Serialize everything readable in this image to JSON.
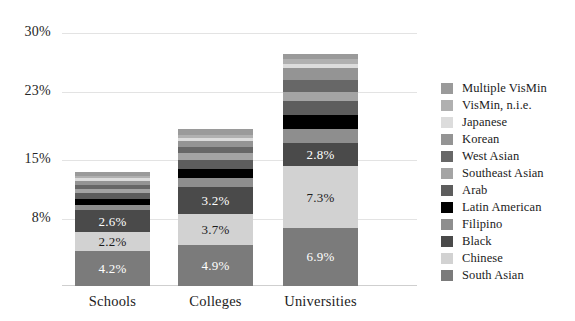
{
  "chart_data": {
    "type": "bar",
    "subtype": "stacked-bar",
    "title": "",
    "xlabel": "",
    "ylabel": "",
    "categories": [
      "Schools",
      "Colleges",
      "Universities"
    ],
    "ylim": [
      0,
      31
    ],
    "yticks": [
      8,
      15,
      23,
      30
    ],
    "ytick_labels": [
      "8%",
      "15%",
      "23%",
      "30%"
    ],
    "grid": true,
    "legend_position": "right",
    "value_suffix": "%",
    "stack_order": "bottom-to-top",
    "series": [
      {
        "name": "South Asian",
        "color": "#7b7b7b",
        "values": [
          4.2,
          4.9,
          6.9
        ],
        "labels": [
          "4.2%",
          "4.9%",
          "6.9%"
        ],
        "label_color": "#ffffff"
      },
      {
        "name": "Chinese",
        "color": "#d2d2d2",
        "values": [
          2.2,
          3.7,
          7.3
        ],
        "labels": [
          "2.2%",
          "3.7%",
          "7.3%"
        ],
        "label_color": "#1c1c1c"
      },
      {
        "name": "Black",
        "color": "#4a4a4a",
        "values": [
          2.6,
          3.2,
          2.8
        ],
        "labels": [
          "2.6%",
          "3.2%",
          "2.8%"
        ],
        "label_color": "#ffffff"
      },
      {
        "name": "Filipino",
        "color": "#8e8e8e",
        "values": [
          0.6,
          1.0,
          1.7
        ],
        "labels": [
          "",
          "",
          ""
        ],
        "label_color": "#ffffff"
      },
      {
        "name": "Latin American",
        "color": "#000000",
        "values": [
          0.7,
          1.1,
          1.6
        ],
        "labels": [
          "",
          "",
          ""
        ],
        "label_color": "#ffffff"
      },
      {
        "name": "Arab",
        "color": "#5d5d5d",
        "values": [
          0.7,
          1.1,
          1.7
        ],
        "labels": [
          "",
          "",
          ""
        ],
        "label_color": "#ffffff"
      },
      {
        "name": "Southeast Asian",
        "color": "#a4a4a4",
        "values": [
          0.5,
          0.8,
          1.0
        ],
        "labels": [
          "",
          "",
          ""
        ],
        "label_color": "#1c1c1c"
      },
      {
        "name": "West Asian",
        "color": "#676767",
        "values": [
          0.5,
          0.7,
          1.5
        ],
        "labels": [
          "",
          "",
          ""
        ],
        "label_color": "#ffffff"
      },
      {
        "name": "Korean",
        "color": "#949494",
        "values": [
          0.5,
          0.7,
          1.4
        ],
        "labels": [
          "",
          "",
          ""
        ],
        "label_color": "#ffffff"
      },
      {
        "name": "Japanese",
        "color": "#dcdcdc",
        "values": [
          0.3,
          0.4,
          0.5
        ],
        "labels": [
          "",
          "",
          ""
        ],
        "label_color": "#1c1c1c"
      },
      {
        "name": "VisMin, n.i.e.",
        "color": "#b0b0b0",
        "values": [
          0.3,
          0.4,
          0.6
        ],
        "labels": [
          "",
          "",
          ""
        ],
        "label_color": "#1c1c1c"
      },
      {
        "name": "Multiple VisMin",
        "color": "#9a9a9a",
        "values": [
          0.5,
          0.6,
          0.6
        ],
        "labels": [
          "",
          "",
          ""
        ],
        "label_color": "#1c1c1c"
      }
    ],
    "totals": [
      13.6,
      18.6,
      27.6
    ]
  },
  "legend": {
    "items": [
      {
        "label": "Multiple VisMin",
        "color": "#9a9a9a"
      },
      {
        "label": "VisMin, n.i.e.",
        "color": "#b0b0b0"
      },
      {
        "label": "Japanese",
        "color": "#dcdcdc"
      },
      {
        "label": "Korean",
        "color": "#949494"
      },
      {
        "label": "West Asian",
        "color": "#676767"
      },
      {
        "label": "Southeast Asian",
        "color": "#a4a4a4"
      },
      {
        "label": "Arab",
        "color": "#5d5d5d"
      },
      {
        "label": "Latin American",
        "color": "#000000"
      },
      {
        "label": "Filipino",
        "color": "#8e8e8e"
      },
      {
        "label": "Black",
        "color": "#4a4a4a"
      },
      {
        "label": "Chinese",
        "color": "#d2d2d2"
      },
      {
        "label": "South Asian",
        "color": "#7b7b7b"
      }
    ]
  },
  "axis": {
    "y_tick_labels": [
      "30%",
      "23%",
      "15%",
      "8%"
    ],
    "x_tick_labels": [
      "Schools",
      "Colleges",
      "Universities"
    ]
  }
}
